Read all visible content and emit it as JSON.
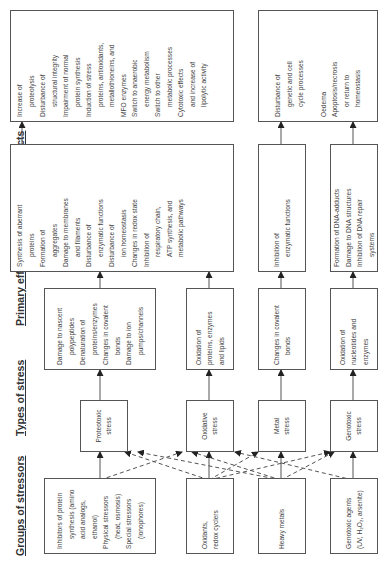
{
  "columns": [
    "Groups of stressors",
    "Types of stress",
    "Primary effects",
    "Secondary effects",
    "Tertiary effects"
  ],
  "stressors": [
    {
      "lines": [
        {
          "t": "Inhibitors of protein",
          "c": false
        },
        {
          "t": "synthesis (amino",
          "c": true
        },
        {
          "t": "acid analogs,",
          "c": true
        },
        {
          "t": "ethanol)",
          "c": true
        },
        {
          "t": "Physical stressors",
          "c": false
        },
        {
          "t": "(heat, osmosis)",
          "c": true
        },
        {
          "t": "Special stressors",
          "c": false
        },
        {
          "t": "(ionophores)",
          "c": true
        }
      ]
    },
    {
      "lines": [
        {
          "t": "Oxidants,",
          "c": false
        },
        {
          "t": "redox cyclers",
          "c": false
        }
      ]
    },
    {
      "lines": [
        {
          "t": "Heavy metals",
          "c": false
        }
      ]
    },
    {
      "lines": [
        {
          "t": "Genotoxic agents",
          "c": false
        },
        {
          "t": "(UV, H₂O₂, arsenite)",
          "c": false
        }
      ]
    }
  ],
  "stress_types": [
    {
      "line1": "Proteotoxic",
      "line2": "stress"
    },
    {
      "line1": "Oxidative",
      "line2": "stress"
    },
    {
      "line1": "Metal",
      "line2": "stress"
    },
    {
      "line1": "Genotoxic",
      "line2": "stress"
    }
  ],
  "primary": [
    {
      "lines": [
        {
          "t": "Damage to nascent",
          "c": false
        },
        {
          "t": "polypeptides",
          "c": true
        },
        {
          "t": "Denaturation of",
          "c": false
        },
        {
          "t": "proteins/enzymes",
          "c": true
        },
        {
          "t": "Changes in covalent",
          "c": false
        },
        {
          "t": "bonds",
          "c": true
        },
        {
          "t": "Damage to ion",
          "c": false
        },
        {
          "t": "pumps/channels",
          "c": true
        }
      ]
    },
    {
      "lines": [
        {
          "t": "Oxidation of",
          "c": false
        },
        {
          "t": "proteins, enzymes",
          "c": false
        },
        {
          "t": "and lipids",
          "c": false
        }
      ]
    },
    {
      "lines": [
        {
          "t": "Changes in covalent",
          "c": false
        },
        {
          "t": "bonds",
          "c": true
        }
      ]
    },
    {
      "lines": [
        {
          "t": "Oxidation of",
          "c": false
        },
        {
          "t": "nucleotides and",
          "c": false
        },
        {
          "t": "enzymes",
          "c": false
        }
      ]
    }
  ],
  "secondary": [
    {
      "lines": [
        {
          "t": "Synthesis of aberrant",
          "c": false
        },
        {
          "t": "proteins",
          "c": true
        },
        {
          "t": "Formation of",
          "c": false
        },
        {
          "t": "aggregates",
          "c": true
        },
        {
          "t": "Damage to membranes",
          "c": false
        },
        {
          "t": "and filaments",
          "c": true
        },
        {
          "t": "Disturbance of",
          "c": false
        },
        {
          "t": "enzymatic functions",
          "c": true
        },
        {
          "t": "Disturbance of",
          "c": false
        },
        {
          "t": "ion homeostasis",
          "c": true
        },
        {
          "t": "Changes in redox state",
          "c": false
        },
        {
          "t": "Inhibition of",
          "c": false
        },
        {
          "t": "respiratory chain,",
          "c": true
        },
        {
          "t": "ATP synthesis, and",
          "c": false
        },
        {
          "t": "metabolic pathways",
          "c": true
        }
      ]
    },
    {
      "lines": [
        {
          "t": "Inhibition of",
          "c": false
        },
        {
          "t": "enzymatic functions",
          "c": true
        }
      ]
    },
    {
      "lines": [
        {
          "t": "Formation of DNA-adducts",
          "c": false
        },
        {
          "t": "Damage to DNA structures",
          "c": false
        },
        {
          "t": "Inhibition of DNA repair",
          "c": false
        },
        {
          "t": "systems",
          "c": true
        }
      ]
    }
  ],
  "tertiary": [
    {
      "lines": [
        {
          "t": "Increase of",
          "c": false
        },
        {
          "t": "proteolysis",
          "c": true
        },
        {
          "t": "Disturbance of",
          "c": false
        },
        {
          "t": "structural integrity",
          "c": true
        },
        {
          "t": "Impairment of normal",
          "c": false
        },
        {
          "t": "protein synthesis",
          "c": true
        },
        {
          "t": "Induction of stress",
          "c": false
        },
        {
          "t": "proteins, antioxidants,",
          "c": true
        },
        {
          "t": "metallothioneins, and",
          "c": true
        },
        {
          "t": "MFO enzymes",
          "c": false
        },
        {
          "t": "Switch to anaerobic",
          "c": false
        },
        {
          "t": "energy metabolism",
          "c": true
        },
        {
          "t": "Switch to other",
          "c": false
        },
        {
          "t": "metabolic processes",
          "c": true
        },
        {
          "t": "Cytotoxic effects",
          "c": false
        },
        {
          "t": "and increase of",
          "c": true
        },
        {
          "t": "lipolytic activity",
          "c": true
        }
      ]
    },
    {
      "lines": [
        {
          "t": "Disturbance of",
          "c": false
        },
        {
          "t": "genetic and cell",
          "c": true
        },
        {
          "t": "cycle processes",
          "c": true
        },
        {
          "t": "",
          "c": false
        },
        {
          "t": "Oedema",
          "c": false
        },
        {
          "t": "Apoptosis/necrosis",
          "c": false
        },
        {
          "t": "or return to",
          "c": true
        },
        {
          "t": "homeostasis",
          "c": true
        }
      ]
    }
  ]
}
